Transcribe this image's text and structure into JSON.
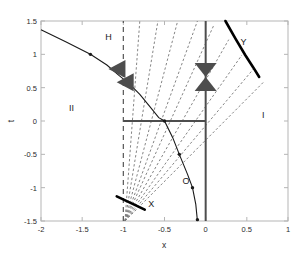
{
  "chart_data": {
    "type": "line",
    "title": "",
    "xlabel": "x",
    "ylabel": "t",
    "xlim": [
      -2,
      1
    ],
    "ylim": [
      -1.5,
      1.5
    ],
    "grid": false,
    "legend": null,
    "xticks": [
      -2,
      -1.5,
      -1,
      -0.5,
      0,
      0.5,
      1
    ],
    "xticklabels": [
      "-2",
      "-1.5",
      "-1",
      "-0.5",
      "0",
      "0.5",
      "1"
    ],
    "yticks": [
      -1.5,
      -1,
      -0.5,
      0,
      0.5,
      1,
      1.5
    ],
    "yticklabels": [
      "-1.5",
      "-1",
      "-0.5",
      "0",
      "0.5",
      "1",
      "1.5"
    ],
    "annotations": [
      {
        "text": "H",
        "x": -1.18,
        "y": 1.22
      },
      {
        "text": "II",
        "x": -1.63,
        "y": 0.15
      },
      {
        "text": "I",
        "x": 0.7,
        "y": 0.05
      },
      {
        "text": "O",
        "x": -0.24,
        "y": -0.95
      },
      {
        "text": "X",
        "x": -0.66,
        "y": -1.29
      },
      {
        "text": "Y",
        "x": 0.46,
        "y": 1.14
      }
    ],
    "series": [
      {
        "name": "characteristic-curve",
        "style": "solid-with-dot-markers",
        "color": "#1a1a1a",
        "points": [
          [
            -2.0,
            1.37
          ],
          [
            -1.7,
            1.19
          ],
          [
            -1.4,
            1.0
          ],
          [
            -1.2,
            0.84
          ],
          [
            -1.05,
            0.68
          ],
          [
            -0.92,
            0.55
          ],
          [
            -0.8,
            0.4
          ],
          [
            -0.68,
            0.22
          ],
          [
            -0.57,
            0.05
          ],
          [
            -0.5,
            0.0
          ],
          [
            -0.4,
            -0.25
          ],
          [
            -0.32,
            -0.5
          ],
          [
            -0.22,
            -0.8
          ],
          [
            -0.16,
            -1.0
          ],
          [
            -0.12,
            -1.25
          ],
          [
            -0.1,
            -1.5
          ]
        ],
        "markers": [
          [
            -1.4,
            1.0
          ],
          [
            -0.92,
            0.55
          ],
          [
            -0.5,
            0.0
          ],
          [
            -0.32,
            -0.5
          ],
          [
            -0.16,
            -1.0
          ],
          [
            -0.1,
            -1.48
          ]
        ]
      },
      {
        "name": "vertical-dashed-line",
        "style": "dashed",
        "color": "#555555",
        "x_const": -1.0,
        "y_range": [
          -1.5,
          1.5
        ]
      },
      {
        "name": "horizontal-axis-segment",
        "style": "solid-thick",
        "color": "#4d4d4d",
        "y_const": 0.0,
        "x_range": [
          -1.0,
          0.0
        ]
      },
      {
        "name": "vertical-axis-segment",
        "style": "solid-thick",
        "color": "#4d4d4d",
        "x_const": 0.0,
        "y_range": [
          -1.5,
          1.5
        ]
      },
      {
        "name": "shock-segment-X",
        "style": "solid-very-thick",
        "color": "#000000",
        "points": [
          [
            -1.08,
            -1.13
          ],
          [
            -0.74,
            -1.33
          ]
        ]
      },
      {
        "name": "shock-arc-Y",
        "style": "solid-very-thick",
        "color": "#000000",
        "points": [
          [
            0.24,
            1.5
          ],
          [
            0.36,
            1.24
          ],
          [
            0.48,
            0.99
          ],
          [
            0.58,
            0.8
          ],
          [
            0.65,
            0.66
          ]
        ]
      }
    ],
    "fan": {
      "name": "rarefaction-fan",
      "style": "dashed",
      "color": "#777777",
      "origin": [
        -0.98,
        -1.5
      ],
      "count": 9,
      "endpoints": [
        [
          -0.8,
          1.5
        ],
        [
          -0.58,
          1.5
        ],
        [
          -0.34,
          1.5
        ],
        [
          -0.1,
          1.5
        ],
        [
          0.1,
          1.44
        ],
        [
          0.28,
          1.22
        ],
        [
          0.44,
          0.99
        ],
        [
          0.58,
          0.78
        ],
        [
          0.7,
          0.58
        ]
      ]
    },
    "markers_bowtie": [
      {
        "name": "bowtie-marker-right",
        "x": 0.0,
        "y": 0.66,
        "orientation": "vertical",
        "color": "#4d4d4d"
      },
      {
        "name": "triangle-marker-left-upper",
        "x": -1.12,
        "y": 0.78,
        "orientation": "left",
        "color": "#4d4d4d"
      },
      {
        "name": "triangle-marker-left-lower",
        "x": -1.02,
        "y": 0.58,
        "orientation": "left",
        "color": "#4d4d4d"
      }
    ]
  },
  "axes": {
    "x_label": "x",
    "y_label": "t"
  },
  "colors": {
    "frame": "#b5b5b5",
    "curve": "#1a1a1a",
    "dashed_fan": "#888888",
    "thick_line": "#4d4d4d",
    "shock": "#000000",
    "text": "#2b2b2b"
  }
}
